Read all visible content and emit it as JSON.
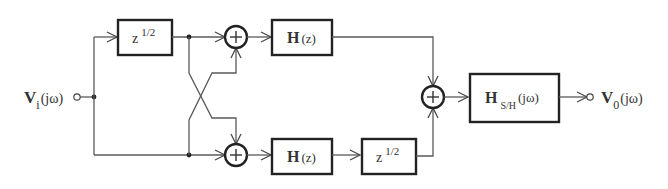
{
  "diagram": {
    "input": {
      "symbol": "V",
      "subscript": "i",
      "arg": "(jω)"
    },
    "output": {
      "symbol": "V",
      "subscript": "0",
      "arg": "(jω)"
    },
    "blocks": {
      "top_delay": {
        "base": "z",
        "exponent": "1/2"
      },
      "top_filter": {
        "symbol": "H",
        "arg": "(z)"
      },
      "bottom_filter": {
        "symbol": "H",
        "arg": "(z)"
      },
      "bottom_delay": {
        "base": "z",
        "exponent": "1/2"
      },
      "sample_hold": {
        "symbol": "H",
        "subscript": "S/H",
        "arg": "(jω)"
      }
    },
    "adders": {
      "top": {
        "sign": "+"
      },
      "bottom": {
        "sign": "+"
      },
      "output": {
        "sign": "+"
      }
    },
    "colors": {
      "wire": "#5a5a5a",
      "block": "#222222",
      "text": "#333333"
    }
  }
}
